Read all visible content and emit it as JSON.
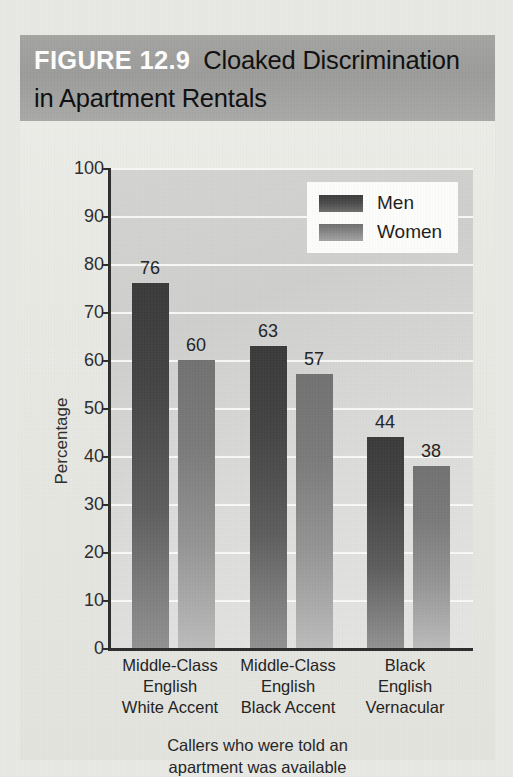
{
  "figure": {
    "number_label": "FIGURE 12.9",
    "title": "Cloaked Discrimination in Apartment Rentals",
    "caption_line1": "Callers who were told an",
    "caption_line2": "apartment was available"
  },
  "colors": {
    "title_band": "#9b9b99",
    "figure_number_text": "#ffffff",
    "title_text": "#0d0d0d",
    "plot_background": "#d6d6d4",
    "gridline": "#fbfbfa",
    "axis": "#2c2c2c",
    "men_bar": "#434343",
    "women_bar": "#858585",
    "page_background": "#e9e9e5"
  },
  "chart_data": {
    "type": "bar",
    "title": "Cloaked Discrimination in Apartment Rentals",
    "xlabel": "",
    "ylabel": "Percentage",
    "ylim": [
      0,
      100
    ],
    "ytick_step": 10,
    "yticks": [
      "100",
      "90",
      "80",
      "70",
      "60",
      "50",
      "40",
      "30",
      "20",
      "10",
      "0"
    ],
    "grid": true,
    "legend_position": "top-right",
    "categories": [
      [
        "Middle-Class",
        "English",
        "White Accent"
      ],
      [
        "Middle-Class",
        "English",
        "Black Accent"
      ],
      [
        "Black",
        "English",
        "Vernacular"
      ]
    ],
    "category_labels_flat": [
      "Middle-Class English White Accent",
      "Middle-Class English Black Accent",
      "Black English Vernacular"
    ],
    "series": [
      {
        "name": "Men",
        "values": [
          76,
          63,
          44
        ]
      },
      {
        "name": "Women",
        "values": [
          60,
          57,
          38
        ]
      }
    ],
    "value_labels": [
      [
        "76",
        "60"
      ],
      [
        "63",
        "57"
      ],
      [
        "44",
        "38"
      ]
    ],
    "caption": "Callers who were told an apartment was available"
  }
}
